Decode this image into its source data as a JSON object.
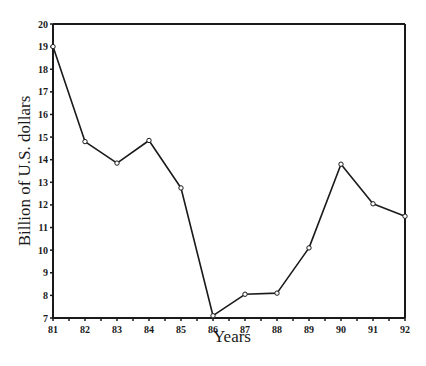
{
  "chart_data": {
    "type": "line",
    "title": "",
    "xlabel": "Years",
    "ylabel": "Billion of U.S. dollars",
    "x": [
      "81",
      "82",
      "83",
      "84",
      "85",
      "86",
      "87",
      "88",
      "89",
      "90",
      "91",
      "92"
    ],
    "series": [
      {
        "name": "Billion of U.S. dollars",
        "values": [
          19.0,
          14.8,
          13.85,
          14.85,
          12.75,
          7.1,
          8.05,
          8.1,
          10.1,
          13.8,
          12.05,
          11.5
        ]
      }
    ],
    "ylim": [
      7,
      20
    ],
    "yticks": [
      "7",
      "8",
      "9",
      "10",
      "11",
      "12",
      "13",
      "14",
      "15",
      "16",
      "17",
      "18",
      "19",
      "20"
    ],
    "xticks": [
      "81",
      "82",
      "83",
      "84",
      "85",
      "86",
      "87",
      "88",
      "89",
      "90",
      "91",
      "92"
    ],
    "grid": false,
    "legend": null,
    "markers": "open-circle",
    "line_color": "#1a1a1a"
  }
}
